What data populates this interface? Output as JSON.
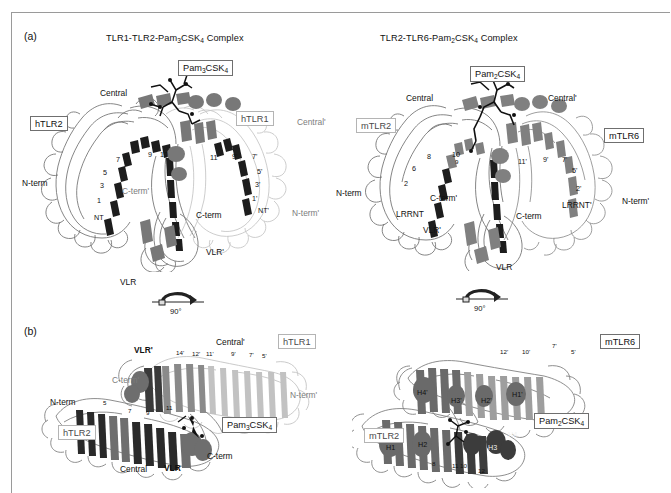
{
  "figure": {
    "panels": [
      {
        "letter": "(a)"
      },
      {
        "letter": "(b)"
      }
    ],
    "titles": {
      "left": "TLR1-TLR2-Pam3CSK4 Complex",
      "right": "TLR2-TLR6-Pam2CSK4 Complex"
    },
    "rotation": {
      "angle": "90°"
    },
    "ligands": {
      "pam3": "Pam3CSK4",
      "pam2": "Pam2CSK4"
    },
    "receptors": {
      "htlr1": "hTLR1",
      "htlr2": "hTLR2",
      "mtlr2": "mTLR2",
      "mtlr6": "mTLR6"
    },
    "panel_a_left": {
      "central": "Central",
      "central_prime": "Central'",
      "n_term": "N-term",
      "n_term_prime": "N-term'",
      "c_term": "C-term",
      "c_term_prime": "C-term'",
      "nt": "NT",
      "nt_prime": "NT'",
      "vlr": "VLR",
      "vlr_prime": "VLR'",
      "numbers_left": [
        "1",
        "3",
        "5",
        "7",
        "9",
        "10"
      ],
      "numbers_right": [
        "1'",
        "3'",
        "5'",
        "7'",
        "9'",
        "11'"
      ]
    },
    "panel_a_right": {
      "central": "Central",
      "central_prime": "Central'",
      "n_term": "N-term",
      "n_term_prime": "N-term'",
      "c_term": "C-term",
      "c_term_prime": "C-term'",
      "lrrnt": "LRRNT",
      "lrrnt_prime": "LRRNT'",
      "vlr": "VLR",
      "vlr_prime": "VLR'",
      "numbers_left": [
        "2",
        "6",
        "8",
        "9",
        "10"
      ],
      "numbers_right": [
        "2'",
        "5'",
        "7'",
        "9'",
        "11'"
      ]
    },
    "panel_b_left": {
      "central": "Central",
      "central_prime": "Central'",
      "n_term": "N-term",
      "n_term_prime": "N-term'",
      "c_term": "C-term",
      "c_term_prime": "C-term'",
      "vlr": "VLR",
      "vlr_prime": "VLR'",
      "numbers_lower": [
        "5",
        "7",
        "9",
        "11"
      ],
      "numbers_upper": [
        "14'",
        "12'",
        "11'",
        "9'",
        "7'",
        "5'"
      ]
    },
    "panel_b_right": {
      "helices_lower": [
        "H1",
        "H2",
        "H3",
        "H4"
      ],
      "helices_upper": [
        "H1'",
        "H2'",
        "H3'",
        "H4'"
      ],
      "numbers_lower": [
        "8",
        "10",
        "11",
        "12"
      ],
      "numbers_upper": [
        "12'",
        "10'",
        "7'",
        "5'"
      ]
    },
    "colors": {
      "outline": "#6f6f6f",
      "dark_strand": "#1d1d1d",
      "mid_strand": "#707070",
      "light_chain": "#c9c9c9",
      "ligand": "#151515",
      "frame": "#9a9a9a"
    }
  }
}
